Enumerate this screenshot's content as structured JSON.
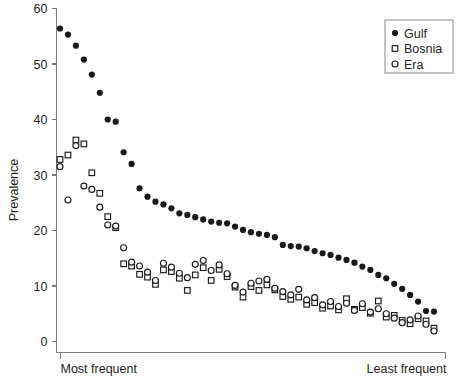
{
  "chart_data": {
    "type": "scatter",
    "title": "",
    "xlabel": "",
    "ylabel": "Prevalence",
    "ylim": [
      0,
      60
    ],
    "yticks": [
      0,
      10,
      20,
      30,
      40,
      50,
      60
    ],
    "ytick_labels": [
      "0",
      "10",
      "20",
      "30",
      "40",
      "50",
      "60"
    ],
    "grid": false,
    "legend_position": "top-right",
    "x_axis_category_labels": {
      "left": "Most frequent",
      "right": "Least frequent"
    },
    "x_description": "Rank-ordered items from most frequent (left) to least frequent (right); no numeric x tick labels are shown",
    "series": [
      {
        "name": "Gulf",
        "marker": "filled-circle",
        "color": "#1a1a1a",
        "x": [
          1,
          2,
          3,
          4,
          5,
          6,
          7,
          8,
          9,
          10,
          11,
          12,
          13,
          14,
          15,
          16,
          17,
          18,
          19,
          20,
          21,
          22,
          23,
          24,
          25,
          26,
          27,
          28,
          29,
          30,
          31,
          32,
          33,
          34,
          35,
          36,
          37,
          38,
          39,
          40,
          41,
          42,
          43,
          44,
          45,
          46,
          47,
          48
        ],
        "values": [
          56.4,
          55.3,
          53.3,
          50.8,
          48.1,
          44.8,
          40.0,
          39.6,
          34.1,
          32.0,
          27.6,
          26.1,
          25.2,
          24.7,
          24.0,
          23.1,
          22.8,
          22.4,
          22.0,
          21.6,
          21.4,
          21.3,
          20.7,
          20.1,
          19.7,
          19.4,
          19.2,
          18.8,
          17.4,
          17.2,
          17.1,
          16.8,
          16.3,
          15.9,
          15.6,
          15.1,
          14.7,
          14.2,
          13.5,
          12.9,
          12.0,
          11.4,
          10.4,
          9.5,
          8.4,
          7.2,
          5.5,
          5.4
        ]
      },
      {
        "name": "Bosnia",
        "marker": "open-square",
        "color": "#1a1a1a",
        "x": [
          1,
          2,
          3,
          4,
          5,
          6,
          7,
          8,
          9,
          10,
          11,
          12,
          13,
          14,
          15,
          16,
          17,
          18,
          19,
          20,
          21,
          22,
          23,
          24,
          25,
          26,
          27,
          28,
          29,
          30,
          31,
          32,
          33,
          34,
          35,
          36,
          37,
          38,
          39,
          40,
          41,
          42,
          43,
          44,
          45,
          46,
          47,
          48
        ],
        "values": [
          32.8,
          33.6,
          36.3,
          35.6,
          30.4,
          26.7,
          22.5,
          20.5,
          14.0,
          13.6,
          12.1,
          11.6,
          10.3,
          12.9,
          12.6,
          11.4,
          9.2,
          12.0,
          13.3,
          11.0,
          13.0,
          11.7,
          9.8,
          8.0,
          9.9,
          9.2,
          10.2,
          9.3,
          8.1,
          7.6,
          8.0,
          6.7,
          7.0,
          6.0,
          6.4,
          5.7,
          7.7,
          5.8,
          6.1,
          5.1,
          7.3,
          4.4,
          4.7,
          3.8,
          3.2,
          4.1,
          3.7,
          2.4
        ]
      },
      {
        "name": "Era",
        "marker": "open-circle",
        "color": "#1a1a1a",
        "x": [
          1,
          2,
          3,
          4,
          5,
          6,
          7,
          8,
          9,
          10,
          11,
          12,
          13,
          14,
          15,
          16,
          17,
          18,
          19,
          20,
          21,
          22,
          23,
          24,
          25,
          26,
          27,
          28,
          29,
          30,
          31,
          32,
          33,
          34,
          35,
          36,
          37,
          38,
          39,
          40,
          41,
          42,
          43,
          44,
          45,
          46,
          47,
          48
        ],
        "values": [
          31.5,
          25.5,
          35.3,
          28.0,
          27.4,
          24.2,
          21.0,
          20.8,
          16.9,
          14.3,
          13.6,
          12.5,
          11.0,
          14.1,
          13.4,
          12.3,
          11.5,
          13.9,
          14.6,
          12.8,
          13.8,
          12.2,
          10.1,
          8.9,
          10.5,
          10.9,
          11.2,
          9.6,
          9.0,
          8.4,
          9.4,
          7.5,
          7.9,
          6.6,
          7.2,
          6.3,
          6.9,
          5.6,
          6.8,
          5.3,
          5.9,
          5.0,
          4.2,
          3.4,
          3.9,
          4.6,
          3.1,
          1.9
        ]
      }
    ],
    "legend": [
      {
        "label": "Gulf",
        "marker": "filled-circle"
      },
      {
        "label": "Bosnia",
        "marker": "open-square"
      },
      {
        "label": "Era",
        "marker": "open-circle"
      }
    ]
  }
}
